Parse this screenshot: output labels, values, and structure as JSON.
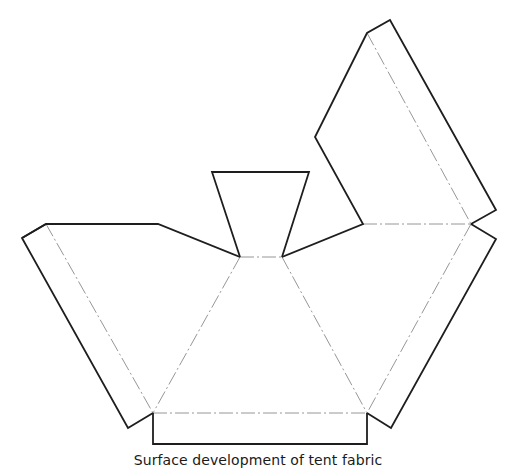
{
  "figure": {
    "caption": "Surface development of tent fabric",
    "colors": {
      "cut_line": "#1e1e1e",
      "fold_line": "#8a8a8a",
      "background": "#ffffff"
    },
    "panels": {
      "left_panel": {
        "cut": "22,238 46,224 158,224 240,257",
        "flap": "46,224 22,238 128,428 153,413"
      },
      "top_trapezoid": {
        "cut": "240,257 212,172 309,172 282,257"
      },
      "right_upper_panel": {
        "cut": "282,257 363,224 315,137 367,33 390,20 496,210 471,224"
      },
      "right_panel": {
        "cut": "471,224 496,239 391,428 367,413"
      },
      "bottom_flap": {
        "cut": "153,413 153,444 367,444 367,413"
      }
    },
    "fold_lines": [
      "240,257 282,257",
      "240,257 153,413",
      "282,257 367,413",
      "153,413 367,413",
      "363,224 471,224",
      "471,224 367,413",
      "46,224 153,413",
      "367,33 471,224"
    ]
  }
}
